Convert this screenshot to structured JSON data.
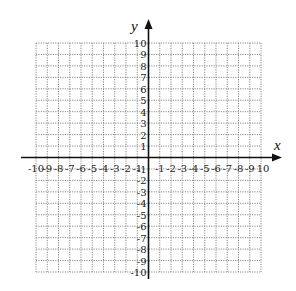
{
  "chart_data": {
    "type": "scatter",
    "title": "",
    "xlabel": "x",
    "ylabel": "y",
    "xlim": [
      -10,
      10
    ],
    "ylim": [
      -10,
      10
    ],
    "grid": true,
    "grid_style": "dotted",
    "x_ticks": [
      -10,
      -9,
      -8,
      -7,
      -6,
      -5,
      -4,
      -3,
      -2,
      -1,
      1,
      2,
      3,
      4,
      5,
      6,
      7,
      8,
      9,
      10
    ],
    "y_ticks": [
      -10,
      -9,
      -8,
      -7,
      -6,
      -5,
      -4,
      -3,
      -2,
      -1,
      1,
      2,
      3,
      4,
      5,
      6,
      7,
      8,
      9,
      10
    ],
    "x_tick_labels_right_of_origin": [
      "-1",
      "-2",
      "-3",
      "-4",
      "-5",
      "-6",
      "-7",
      "-8",
      "-9",
      "10"
    ],
    "x_tick_labels_left_of_origin": [
      "-10",
      "-9",
      "-8",
      "-7",
      "-6",
      "-5",
      "-4",
      "-3",
      "-2",
      "-1"
    ],
    "y_tick_labels_above_origin": [
      "1",
      "2",
      "3",
      "4",
      "5",
      "6",
      "7",
      "8",
      "9",
      "10"
    ],
    "y_tick_labels_below_origin": [
      "-1",
      "-2",
      "-3",
      "-4",
      "-5",
      "-6",
      "-7",
      "-8",
      "-9",
      "-10"
    ],
    "series": [],
    "legend": null
  },
  "axes": {
    "x_name": "x",
    "y_name": "y"
  },
  "colors": {
    "grid": "#8a8a8a",
    "axis": "#111111",
    "text": "#222222",
    "background": "#ffffff"
  },
  "layout": {
    "grid_left": 36,
    "grid_top": 43,
    "grid_right": 261,
    "grid_bottom": 272,
    "origin_x": 148.5,
    "origin_y": 157.5,
    "x_axis_start": 21,
    "x_axis_end": 282,
    "y_axis_top": 19,
    "y_axis_bottom": 279
  }
}
